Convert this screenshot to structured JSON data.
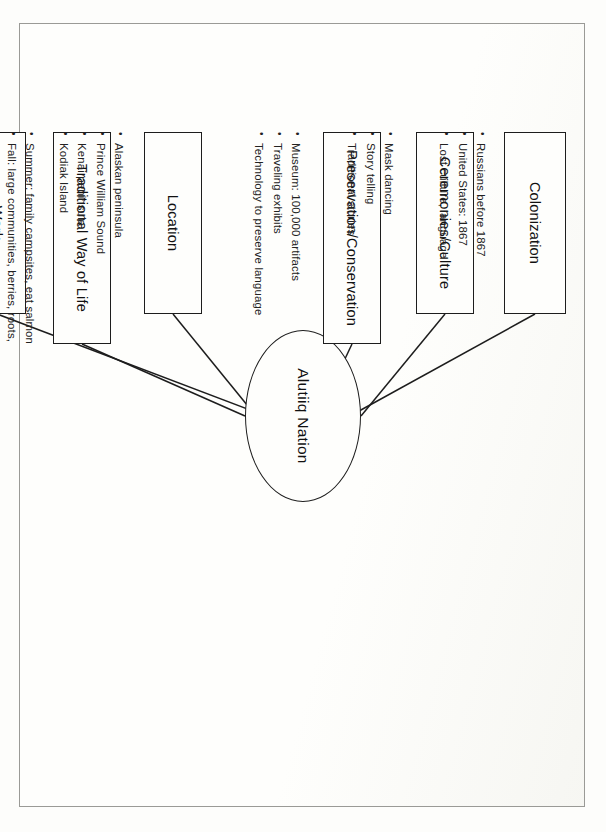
{
  "diagram": {
    "type": "concept-map",
    "orientation": "page rotated 90 degrees",
    "center": {
      "label": "Alutiiq Nation"
    },
    "nodes": [
      {
        "id": "colonization",
        "label": "Colonization",
        "bullets": [
          "Russians before 1867",
          "United States: 1867",
          "Lost culture, language"
        ]
      },
      {
        "id": "ceremonies",
        "label": "Ceremonies/Culture",
        "bullets": [
          "Mask dancing",
          "Story telling",
          "Traditional stories"
        ]
      },
      {
        "id": "preservation",
        "label": "Preservation/Conservation",
        "bullets": [
          "Museum: 100,000 artifacts",
          "Traveling exhibits",
          "Technology to preserve language"
        ]
      },
      {
        "id": "location",
        "label": "Location",
        "bullets": [
          "Alaskan peninsula",
          "Prince William Sound",
          "Kenai peninsula",
          "Kodiak Island"
        ]
      },
      {
        "id": "traditional",
        "label": "Traditional Way of Life",
        "bullets": [
          "Summer: family campsites, eat salmon",
          "Fall: large communities, berries, roots,\nhunt whales, seals",
          "Winter: live on stored food"
        ]
      },
      {
        "id": "work",
        "label": "Work",
        "bullets": [
          "Women:\npreserve food, make clothing from skins",
          "Men:\nrepair/make tools, build houses and\nboats, hunt food"
        ]
      }
    ]
  },
  "colors": {
    "ink": "#1d1d1d",
    "paper": "#fefefc",
    "border": "#9a9a96"
  }
}
